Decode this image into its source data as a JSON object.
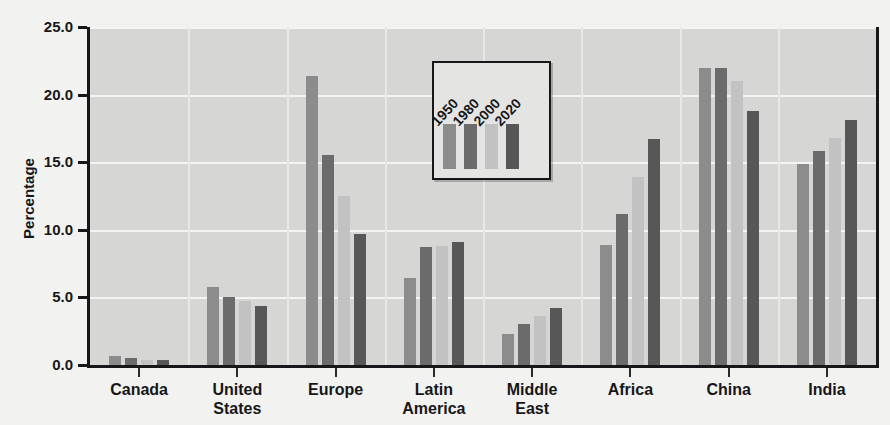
{
  "chart_data": {
    "type": "bar",
    "title": "",
    "xlabel": "",
    "ylabel": "Percentage",
    "ylim": [
      0,
      25
    ],
    "ytick_labels": [
      "0.0",
      "5.0",
      "10.0",
      "15.0",
      "20.0",
      "25.0"
    ],
    "ytick_values": [
      0,
      5,
      10,
      15,
      20,
      25
    ],
    "grid": true,
    "legend_position": "inside-top-center",
    "categories": [
      "Canada",
      "United\nStates",
      "Europe",
      "Latin\nAmerica",
      "Middle\nEast",
      "Africa",
      "China",
      "India"
    ],
    "category_labels": [
      {
        "line1": "Canada",
        "line2": ""
      },
      {
        "line1": "United",
        "line2": "States"
      },
      {
        "line1": "Europe",
        "line2": ""
      },
      {
        "line1": "Latin",
        "line2": "America"
      },
      {
        "line1": "Middle",
        "line2": "East"
      },
      {
        "line1": "Africa",
        "line2": ""
      },
      {
        "line1": "China",
        "line2": ""
      },
      {
        "line1": "India",
        "line2": ""
      }
    ],
    "series": [
      {
        "name": "1950",
        "color": "#8c8c8c",
        "values": [
          0.7,
          5.8,
          21.4,
          6.4,
          2.3,
          8.9,
          22.0,
          14.9
        ]
      },
      {
        "name": "1980",
        "color": "#6b6b6b",
        "values": [
          0.5,
          5.0,
          15.5,
          8.7,
          3.0,
          11.2,
          22.0,
          15.8
        ]
      },
      {
        "name": "2000",
        "color": "#c2c2c2",
        "values": [
          0.4,
          4.7,
          12.5,
          8.8,
          3.6,
          13.9,
          21.0,
          16.8
        ]
      },
      {
        "name": "2020",
        "color": "#575757",
        "values": [
          0.4,
          4.4,
          9.7,
          9.1,
          4.2,
          16.7,
          18.8,
          18.1
        ]
      }
    ]
  },
  "legend": {
    "entries": [
      "1950",
      "1980",
      "2000",
      "2020"
    ]
  },
  "colors": {
    "plot_background": "#d6d6d4",
    "page_background": "#f2f2f0",
    "axis": "#17171a",
    "gridline": "#f4f4f2",
    "series_1950": "#8c8c8c",
    "series_1980": "#6b6b6b",
    "series_2000": "#c2c2c2",
    "series_2020": "#575757"
  }
}
